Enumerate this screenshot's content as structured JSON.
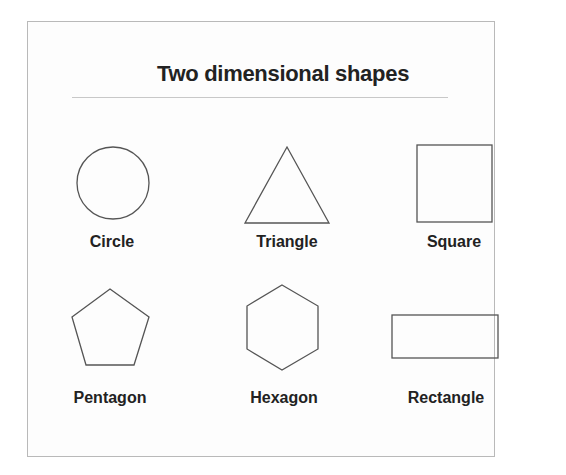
{
  "title": "Two dimensional shapes",
  "stroke_color": "#555555",
  "shapes": [
    {
      "name": "circle",
      "label": "Circle"
    },
    {
      "name": "triangle",
      "label": "Triangle"
    },
    {
      "name": "square",
      "label": "Square"
    },
    {
      "name": "pentagon",
      "label": "Pentagon"
    },
    {
      "name": "hexagon",
      "label": "Hexagon"
    },
    {
      "name": "rectangle",
      "label": "Rectangle"
    }
  ]
}
